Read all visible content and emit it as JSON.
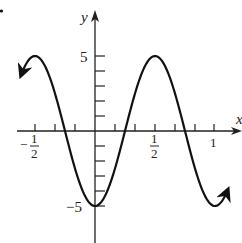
{
  "chart_data": {
    "type": "line",
    "title": "",
    "xlabel": "x",
    "ylabel": "y",
    "function": "y = -5 cos(2πx)",
    "xlim": [
      -0.62,
      1.11
    ],
    "ylim": [
      -6,
      7
    ],
    "grid": false,
    "legend": null,
    "x_tick_labels": [
      {
        "value": -0.5,
        "label_num": "1",
        "label_den": "2",
        "sign": "−"
      },
      {
        "value": 0.5,
        "label_num": "1",
        "label_den": "2",
        "sign": ""
      },
      {
        "value": 1,
        "label": "1"
      }
    ],
    "x_minor_tick_step": 0.1667,
    "y_tick_labels": [
      {
        "value": 5,
        "label": "5"
      },
      {
        "value": -5,
        "label": "−5"
      }
    ],
    "y_minor_tick_step": 1,
    "series": [
      {
        "name": "y = -5cos(2πx)",
        "x": [
          -0.62,
          -0.5,
          -0.25,
          0,
          0.25,
          0.5,
          0.75,
          1,
          1.11
        ],
        "y": [
          3.64,
          5,
          0,
          -5,
          0,
          5,
          0,
          -5,
          -3.87
        ],
        "arrows_at_ends": true
      }
    ],
    "key_points": [
      {
        "x": -0.5,
        "y": 5,
        "type": "max"
      },
      {
        "x": 0,
        "y": -5,
        "type": "min"
      },
      {
        "x": 0.5,
        "y": 5,
        "type": "max"
      },
      {
        "x": 1,
        "y": -5,
        "type": "min"
      }
    ]
  },
  "labels": {
    "x_axis": "x",
    "y_axis": "y",
    "y_pos5": "5",
    "y_neg5": "−5",
    "x_neg_half_sign": "−",
    "x_neg_half_num": "1",
    "x_neg_half_den": "2",
    "x_half_num": "1",
    "x_half_den": "2",
    "x_one": "1"
  }
}
